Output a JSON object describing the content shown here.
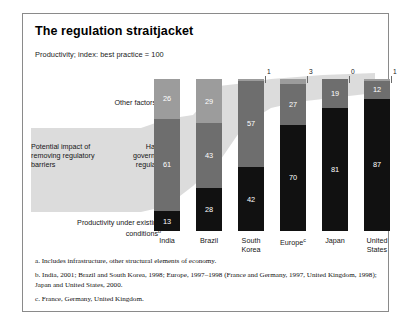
{
  "title": "The regulation straitjacket",
  "subtitle": "Productivity; index: best practice = 100",
  "labels": {
    "other_factors": "Other factors",
    "other_factors_sup": "a",
    "potential_impact": "Potential impact of removing regulatory barriers",
    "harmful_regulations": "Harmful government regulations",
    "productivity_existing": "Productivity under existing conditions",
    "productivity_existing_sup": "b"
  },
  "footnotes": [
    "a. Includes infrastructure, other structural elements of economy.",
    "b. India, 2001; Brazil and South Korea, 1998; Europe, 1997–1998 (France and Germany, 1997, United Kingdom, 1998); Japan and United States, 2000.",
    "c. France, Germany, United Kingdom."
  ],
  "chart_data": {
    "type": "bar",
    "title": "The regulation straitjacket",
    "subtitle": "Productivity; index: best practice = 100",
    "xlabel": "",
    "ylabel": "Productivity; index: best practice = 100",
    "ylim": [
      0,
      100
    ],
    "grid": false,
    "legend": "left-side category labels",
    "stacked": true,
    "categories": [
      "India",
      "Brazil",
      "South Korea",
      "Europe",
      "Japan",
      "United States"
    ],
    "category_sup": [
      "",
      "",
      "",
      "c",
      "",
      ""
    ],
    "category_lines": [
      [
        "India"
      ],
      [
        "Brazil"
      ],
      [
        "South",
        "Korea"
      ],
      [
        "Europe"
      ],
      [
        "Japan"
      ],
      [
        "United",
        "States"
      ]
    ],
    "series": [
      {
        "name": "Productivity under existing conditions",
        "color": "#111111",
        "values": [
          13,
          28,
          42,
          70,
          81,
          87
        ]
      },
      {
        "name": "Harmful government regulations",
        "color": "#6e6e6e",
        "values": [
          61,
          43,
          57,
          27,
          19,
          12
        ]
      },
      {
        "name": "Other factors",
        "color": "#9c9c9c",
        "values": [
          26,
          29,
          1,
          3,
          0,
          1
        ]
      }
    ],
    "top_annotations": [
      "",
      "",
      "1",
      "3",
      "0",
      "1"
    ],
    "totals": [
      100,
      100,
      100,
      100,
      100,
      100
    ]
  }
}
